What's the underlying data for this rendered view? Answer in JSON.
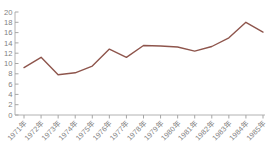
{
  "chart_data": {
    "type": "line",
    "title": "",
    "categories": [
      "1971年",
      "1972年",
      "1973年",
      "1974年",
      "1975年",
      "1976年",
      "1977年",
      "1978年",
      "1979年",
      "1980年",
      "1981年",
      "1982年",
      "1983年",
      "1984年",
      "1985年"
    ],
    "values": [
      9.2,
      11.2,
      7.8,
      8.2,
      9.5,
      12.8,
      11.2,
      13.5,
      13.4,
      13.2,
      12.4,
      13.3,
      15.0,
      18.0,
      16.1
    ],
    "xlabel": "",
    "ylabel": "",
    "ylim": [
      0,
      20
    ],
    "yticks": [
      0,
      2,
      4,
      6,
      8,
      10,
      12,
      14,
      16,
      18,
      20
    ],
    "grid": false,
    "legend": "none",
    "line_color": "#8e554c",
    "axis_color": "#b2b2b2",
    "tick_color": "#a6a6a6",
    "label_color": "#7f7f7f"
  }
}
